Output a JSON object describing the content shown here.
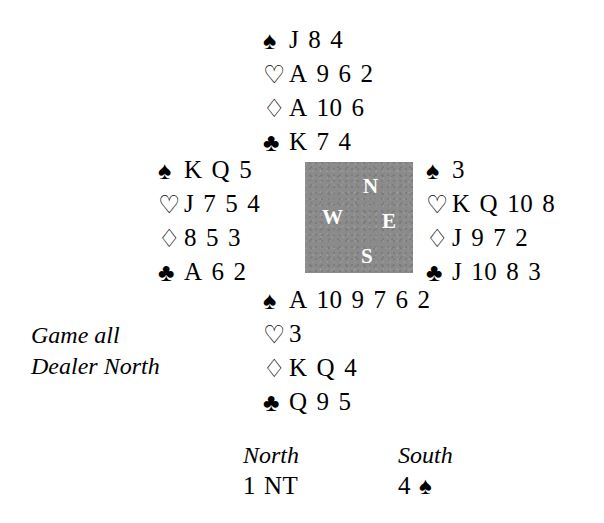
{
  "diagram": {
    "type": "bridge-hand-diagram",
    "conditions": {
      "vulnerability": "Game all",
      "dealer": "Dealer North"
    },
    "compass": {
      "north": "N",
      "west": "W",
      "east": "E",
      "south": "S",
      "box_color": "#8b8b8b",
      "letter_color": "#ffffff"
    },
    "suit_symbols": {
      "spades": "♠",
      "hearts": "♡",
      "diamonds": "♢",
      "clubs": "♣"
    },
    "hands": {
      "north": {
        "label": "North",
        "spades": [
          "J",
          "8",
          "4"
        ],
        "hearts": [
          "A",
          "9",
          "6",
          "2"
        ],
        "diamonds": [
          "A",
          "10",
          "6"
        ],
        "clubs": [
          "K",
          "7",
          "4"
        ]
      },
      "west": {
        "label": "West",
        "spades": [
          "K",
          "Q",
          "5"
        ],
        "hearts": [
          "J",
          "7",
          "5",
          "4"
        ],
        "diamonds": [
          "8",
          "5",
          "3"
        ],
        "clubs": [
          "A",
          "6",
          "2"
        ]
      },
      "east": {
        "label": "East",
        "spades": [
          "3"
        ],
        "hearts": [
          "K",
          "Q",
          "10",
          "8"
        ],
        "diamonds": [
          "J",
          "9",
          "7",
          "2"
        ],
        "clubs": [
          "J",
          "10",
          "8",
          "3"
        ]
      },
      "south": {
        "label": "South",
        "spades": [
          "A",
          "10",
          "9",
          "7",
          "6",
          "2"
        ],
        "hearts": [
          "3"
        ],
        "diamonds": [
          "K",
          "Q",
          "4"
        ],
        "clubs": [
          "Q",
          "9",
          "5"
        ]
      }
    },
    "auction": {
      "columns": [
        {
          "seat": "North",
          "bid_level": "1",
          "bid_denomination": "NT",
          "bid_suit_symbol": ""
        },
        {
          "seat": "South",
          "bid_level": "4",
          "bid_denomination": "",
          "bid_suit_symbol": "♠"
        }
      ]
    }
  }
}
